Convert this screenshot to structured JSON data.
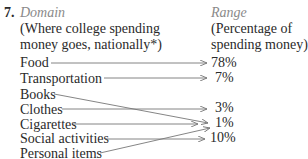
{
  "problem": {
    "number": "7.",
    "domain_heading": "Domain",
    "domain_desc_line1": "(Where college spending",
    "domain_desc_line2": "money goes, nationally*)",
    "range_heading": "Range",
    "range_desc_line1": "(Percentage of",
    "range_desc_line2": "spending money)"
  },
  "domain": [
    "Food",
    "Transportation",
    "Books",
    "Clothes",
    "Cigarettes",
    "Social activities",
    "Personal items"
  ],
  "range": [
    "78%",
    "7%",
    "3%",
    "1%",
    "10%"
  ],
  "mapping": [
    {
      "from": "Food",
      "to": "78%"
    },
    {
      "from": "Transportation",
      "to": "7%"
    },
    {
      "from": "Books",
      "to": "1%"
    },
    {
      "from": "Clothes",
      "to": "3%"
    },
    {
      "from": "Cigarettes",
      "to": "1%"
    },
    {
      "from": "Social activities",
      "to": "10%"
    },
    {
      "from": "Personal items",
      "to": "1%"
    }
  ],
  "colors": {
    "text": "#2a2a2a",
    "heading_italic": "#8a8a8a",
    "arrow": "#777777"
  }
}
